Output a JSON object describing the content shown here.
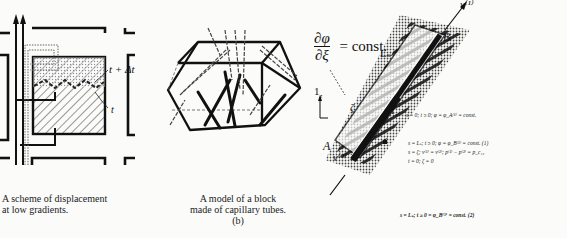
{
  "panel_a": {
    "caption_line1": "A scheme of displacement",
    "caption_line2": "at low gradients.",
    "label_t_dt": "t + Δt",
    "label_t": "t"
  },
  "panel_b": {
    "caption_line1": "A model of a block",
    "caption_line2": "made of capillary tubes.",
    "caption_tag": "(b)"
  },
  "panel_c": {
    "formula_num": "∂φ",
    "formula_den": "∂ξ",
    "formula_rhs": "= const.",
    "label_v1": "v⁽¹⁾",
    "label_v2": "v⁽²⁾",
    "label_B": "B",
    "label_A": "A",
    "label_Ls": "Lₛ",
    "label_1z": "1",
    "label_1z_sub": "z",
    "label_1s": "1",
    "label_1s_sub": "s",
    "label_zeta": "ζ",
    "equations": [
      "s = 0;  t ≥ 0;  φ = φ_A⁽¹⁾ = const.",
      "s = Lₛ;  t ≥ 0;  φ = φ_B⁽¹⁾ = const.  (1)",
      "s = ζ;  v⁽¹⁾ = v⁽²⁾;  p⁽¹⁾ − p⁽²⁾ = p_c₁₂",
      "t = 0;  ζ = 0"
    ],
    "equation_2": "s = Lₛ;  t ≥ 0 =  φ_B⁽¹⁾ = const. (2)"
  }
}
